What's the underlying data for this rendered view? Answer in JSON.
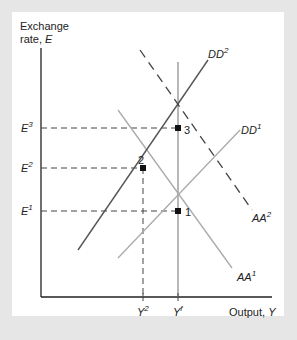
{
  "chart_data": {
    "type": "line",
    "title": "",
    "ylabel": "Exchange rate, E",
    "xlabel": "Output, Y",
    "ylabel_line1": "Exchange",
    "ylabel_line2": "rate, ",
    "ylabel_var": "E",
    "xlabel_text": "Output, ",
    "xlabel_var": "Y",
    "y_ticks": [
      {
        "label": "E",
        "sup": "3",
        "y": 128
      },
      {
        "label": "E",
        "sup": "2",
        "y": 168
      },
      {
        "label": "E",
        "sup": "1",
        "y": 211
      }
    ],
    "x_ticks": [
      {
        "label": "Y",
        "sup": "2",
        "x": 143
      },
      {
        "label": "Y",
        "sup": "f",
        "x": 178
      }
    ],
    "series": [
      {
        "name": "DD1",
        "label": "DD",
        "sup": "1",
        "style": "solid",
        "color": "#aaaaaa",
        "points": [
          [
            118,
            258
          ],
          [
            240,
            130
          ]
        ]
      },
      {
        "name": "DD2",
        "label": "DD",
        "sup": "2",
        "style": "solid",
        "color": "#555555",
        "points": [
          [
            78,
            250
          ],
          [
            208,
            60
          ]
        ]
      },
      {
        "name": "AA1",
        "label": "AA",
        "sup": "1",
        "style": "solid",
        "color": "#aaaaaa",
        "points": [
          [
            118,
            110
          ],
          [
            232,
            268
          ]
        ]
      },
      {
        "name": "AA2",
        "label": "AA",
        "sup": "2",
        "style": "dashed",
        "color": "#444444",
        "points": [
          [
            140,
            50
          ],
          [
            252,
            210
          ]
        ]
      },
      {
        "name": "Yf",
        "label": "",
        "style": "solid",
        "color": "#888888",
        "points": [
          [
            178,
            62
          ],
          [
            178,
            297
          ]
        ]
      }
    ],
    "equilibria": [
      {
        "label": "1",
        "x": 178,
        "y": 211
      },
      {
        "label": "2",
        "x": 143,
        "y": 168
      },
      {
        "label": "3",
        "x": 178,
        "y": 128
      }
    ],
    "grid": false
  }
}
